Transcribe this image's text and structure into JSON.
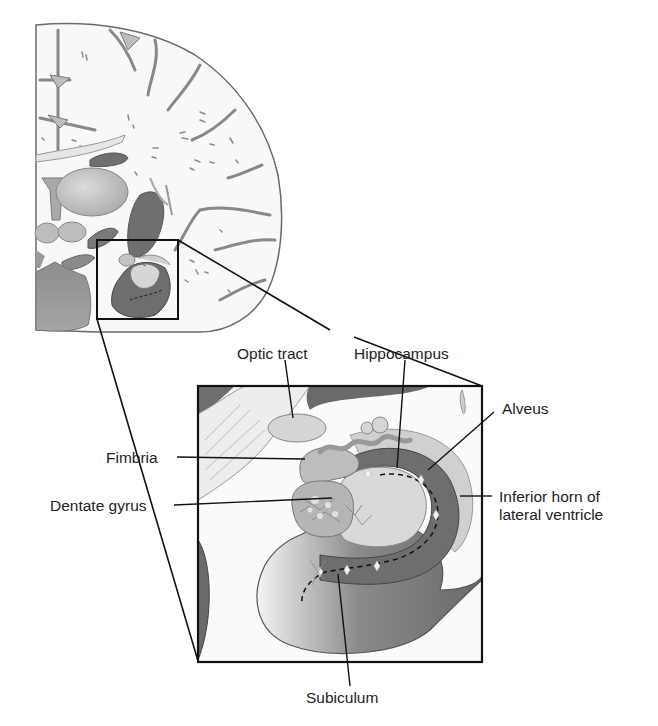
{
  "figure": {
    "type": "anatomical-diagram",
    "colors": {
      "outline": "#555555",
      "frame": "#111111",
      "white_matter": "#f7f7f7",
      "gray_light": "#cfcfcf",
      "gray_mid": "#a9a9a9",
      "gray_dark": "#6e6e6e",
      "gray_darkest": "#5a5a5a"
    }
  },
  "labels": {
    "optic_tract": "Optic tract",
    "hippocampus": "Hippocampus",
    "alveus": "Alveus",
    "fimbria": "Fimbria",
    "dentate_gyrus": "Dentate gyrus",
    "inferior_horn_line1": "Inferior horn of",
    "inferior_horn_line2": "lateral ventricle",
    "subiculum": "Subiculum"
  }
}
